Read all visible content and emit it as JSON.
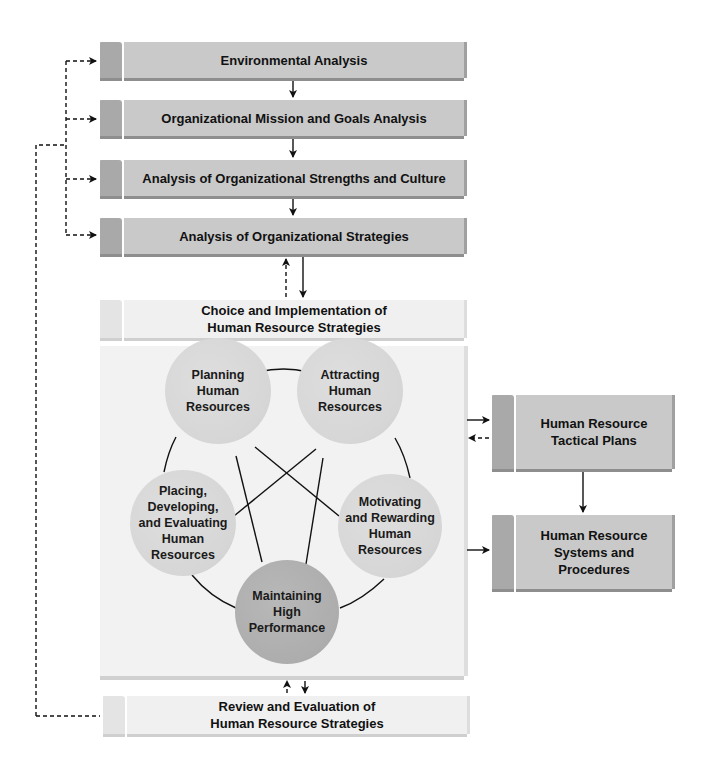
{
  "diagram": {
    "analysis_steps": [
      {
        "label": "Environmental Analysis"
      },
      {
        "label": "Organizational Mission and Goals Analysis"
      },
      {
        "label": "Analysis of Organizational Strengths and Culture"
      },
      {
        "label": "Analysis of Organizational Strategies"
      }
    ],
    "choice_box": {
      "line1": "Choice and Implementation of",
      "line2": "Human Resource Strategies"
    },
    "review_box": {
      "line1": "Review and Evaluation of",
      "line2": "Human Resource Strategies"
    },
    "circles": [
      {
        "id": "planning",
        "lines": [
          "Planning",
          "Human",
          "Resources"
        ]
      },
      {
        "id": "attracting",
        "lines": [
          "Attracting",
          "Human",
          "Resources"
        ]
      },
      {
        "id": "placing",
        "lines": [
          "Placing,",
          "Developing,",
          "and Evaluating",
          "Human",
          "Resources"
        ]
      },
      {
        "id": "motivating",
        "lines": [
          "Motivating",
          "and Rewarding",
          "Human",
          "Resources"
        ]
      },
      {
        "id": "maintaining",
        "lines": [
          "Maintaining",
          "High",
          "Performance"
        ]
      }
    ],
    "right_boxes": [
      {
        "line1": "Human Resource",
        "line2": "Tactical Plans"
      },
      {
        "line1": "Human Resource",
        "line2": "Systems and",
        "line3": "Procedures"
      }
    ],
    "colors": {
      "bar_dark": "#c9c9c9",
      "tab_dark": "#a9a9a9",
      "bar_light": "#f0f0f0",
      "panel": "#f2f2f2",
      "circle": "#d8d8d8",
      "circle_center": "#adadad",
      "line": "#111111"
    }
  }
}
